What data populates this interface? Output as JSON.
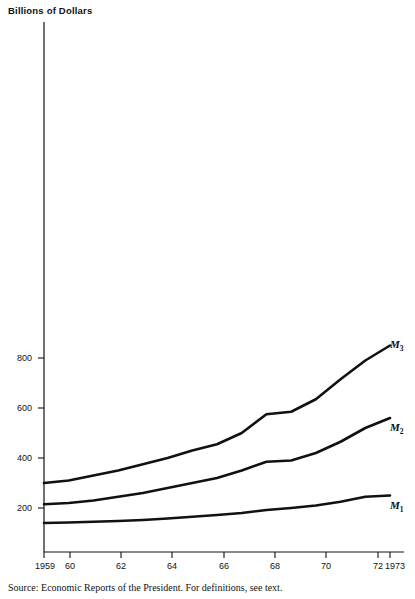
{
  "chart_data": {
    "type": "line",
    "title": "Billions of Dollars",
    "xlabel": "",
    "ylabel": "Billions of Dollars",
    "x": [
      1959,
      1960,
      1961,
      1962,
      1963,
      1964,
      1965,
      1966,
      1967,
      1968,
      1969,
      1970,
      1971,
      1972,
      1973
    ],
    "xtick_labels": [
      "1959",
      "60",
      "62",
      "64",
      "66",
      "68",
      "70",
      "72",
      "1973"
    ],
    "xtick_values": [
      1959,
      1960,
      1962,
      1964,
      1966,
      1968,
      1970,
      1972,
      1973
    ],
    "ytick_labels": [
      "200",
      "400",
      "600",
      "800"
    ],
    "ytick_values": [
      200,
      400,
      600,
      800
    ],
    "xlim": [
      1959,
      1973
    ],
    "ylim": [
      0,
      1000
    ],
    "grid": false,
    "legend": "inline-right-end",
    "series": [
      {
        "name": "M3",
        "label": "M",
        "subscript": "3",
        "values": [
          300,
          310,
          330,
          350,
          375,
          400,
          430,
          455,
          500,
          575,
          585,
          635,
          715,
          790,
          850
        ]
      },
      {
        "name": "M2",
        "label": "M",
        "subscript": "2",
        "values": [
          215,
          220,
          230,
          245,
          260,
          280,
          300,
          320,
          350,
          385,
          390,
          420,
          465,
          520,
          560
        ]
      },
      {
        "name": "M1",
        "label": "M",
        "subscript": "1",
        "values": [
          140,
          142,
          145,
          148,
          152,
          158,
          165,
          172,
          180,
          192,
          200,
          210,
          225,
          245,
          250
        ]
      }
    ],
    "source": "Source: Economic Reports of the President. For definitions, see text."
  },
  "axis": {
    "y_title": "Billions of Dollars",
    "ticks_y": [
      "200",
      "400",
      "600",
      "800"
    ],
    "ticks_x": [
      "1959",
      "60",
      "62",
      "64",
      "66",
      "68",
      "70",
      "72",
      "1973"
    ]
  },
  "labels": {
    "m3": "M",
    "m3_sub": "3",
    "m2": "M",
    "m2_sub": "2",
    "m1": "M",
    "m1_sub": "1"
  },
  "footer": {
    "source": "Source: Economic Reports of the President. For definitions, see text."
  },
  "colors": {
    "ink": "#111111",
    "background": "#ffffff"
  }
}
